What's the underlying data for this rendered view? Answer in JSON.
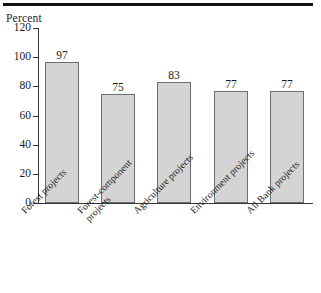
{
  "figure": {
    "axis_title": "Percent",
    "top_rule_color": "#121212"
  },
  "chart_data": {
    "type": "bar",
    "title": "",
    "subtitle": "",
    "xlabel": "",
    "ylabel": "Percent",
    "ylim": [
      0,
      120
    ],
    "yticks": [
      0,
      20,
      40,
      60,
      80,
      100,
      120
    ],
    "ytick_labels": [
      "0",
      "20",
      "40",
      "60",
      "80",
      "100",
      "120"
    ],
    "grid": false,
    "legend": null,
    "bar_color": "#d4d4d4",
    "bar_edge_color": "#6f6f73",
    "categories": [
      "Forest projects",
      "Forest-component\nprojects",
      "Agriculture projects",
      "Environment projects",
      "All Bank projects"
    ],
    "values": [
      97,
      75,
      83,
      77,
      77
    ],
    "value_labels": [
      "97",
      "75",
      "83",
      "77",
      "77"
    ]
  }
}
